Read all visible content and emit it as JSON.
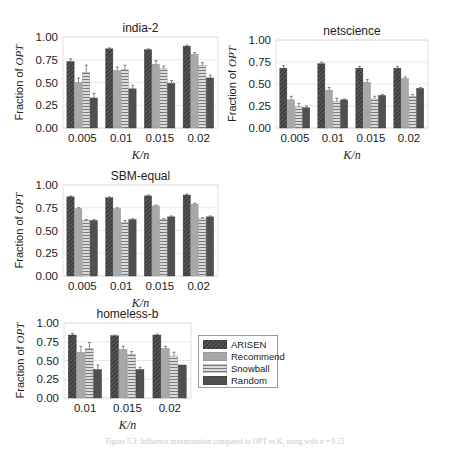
{
  "chart_data": [
    {
      "type": "bar",
      "title": "india-2",
      "xlabel": "K/n",
      "ylabel": "Fraction of OPT",
      "ylim": [
        0,
        1
      ],
      "yticks": [
        "0.00",
        "0.25",
        "0.50",
        "0.75",
        "1.00"
      ],
      "categories": [
        "0.005",
        "0.01",
        "0.015",
        "0.02"
      ],
      "series": [
        {
          "name": "ARISEN",
          "values": [
            0.73,
            0.87,
            0.86,
            0.9
          ],
          "errors": [
            0.03,
            0.01,
            0.01,
            0.01
          ]
        },
        {
          "name": "Recommend",
          "values": [
            0.5,
            0.63,
            0.7,
            0.81
          ],
          "errors": [
            0.05,
            0.04,
            0.04,
            0.02
          ]
        },
        {
          "name": "Snowball",
          "values": [
            0.61,
            0.64,
            0.65,
            0.69
          ],
          "errors": [
            0.08,
            0.05,
            0.03,
            0.03
          ]
        },
        {
          "name": "Random",
          "values": [
            0.33,
            0.43,
            0.49,
            0.55
          ],
          "errors": [
            0.05,
            0.04,
            0.03,
            0.03
          ]
        }
      ],
      "grid": true
    },
    {
      "type": "bar",
      "title": "netscience",
      "xlabel": "K/n",
      "ylabel": "Fraction of OPT",
      "ylim": [
        0,
        1
      ],
      "yticks": [
        "0.00",
        "0.25",
        "0.50",
        "0.75",
        "1.00"
      ],
      "categories": [
        "0.005",
        "0.01",
        "0.015",
        "0.02"
      ],
      "series": [
        {
          "name": "ARISEN",
          "values": [
            0.68,
            0.73,
            0.68,
            0.68
          ],
          "errors": [
            0.03,
            0.02,
            0.02,
            0.02
          ]
        },
        {
          "name": "Recommend",
          "values": [
            0.32,
            0.43,
            0.52,
            0.56
          ],
          "errors": [
            0.04,
            0.03,
            0.03,
            0.02
          ]
        },
        {
          "name": "Snowball",
          "values": [
            0.24,
            0.3,
            0.33,
            0.36
          ],
          "errors": [
            0.04,
            0.04,
            0.03,
            0.02
          ]
        },
        {
          "name": "Random",
          "values": [
            0.23,
            0.32,
            0.37,
            0.45
          ],
          "errors": [
            0.02,
            0.01,
            0.01,
            0.01
          ]
        }
      ],
      "grid": true
    },
    {
      "type": "bar",
      "title": "SBM-equal",
      "xlabel": "K/n",
      "ylabel": "Fraction of OPT",
      "ylim": [
        0,
        1
      ],
      "yticks": [
        "0.00",
        "0.25",
        "0.50",
        "0.75",
        "1.00"
      ],
      "categories": [
        "0.005",
        "0.01",
        "0.015",
        "0.02"
      ],
      "series": [
        {
          "name": "ARISEN",
          "values": [
            0.87,
            0.86,
            0.88,
            0.89
          ],
          "errors": [
            0.01,
            0.01,
            0.01,
            0.01
          ]
        },
        {
          "name": "Recommend",
          "values": [
            0.74,
            0.74,
            0.77,
            0.79
          ],
          "errors": [
            0.01,
            0.01,
            0.01,
            0.01
          ]
        },
        {
          "name": "Snowball",
          "values": [
            0.61,
            0.59,
            0.62,
            0.63
          ],
          "errors": [
            0.01,
            0.02,
            0.01,
            0.01
          ]
        },
        {
          "name": "Random",
          "values": [
            0.61,
            0.62,
            0.65,
            0.65
          ],
          "errors": [
            0.01,
            0.01,
            0.01,
            0.01
          ]
        }
      ],
      "grid": true
    },
    {
      "type": "bar",
      "title": "homeless-b",
      "xlabel": "K/n",
      "ylabel": "Fraction of OPT",
      "ylim": [
        0,
        1
      ],
      "yticks": [
        "0.00",
        "0.25",
        "0.50",
        "0.75",
        "1.00"
      ],
      "categories": [
        "0.01",
        "0.015",
        "0.02"
      ],
      "series": [
        {
          "name": "ARISEN",
          "values": [
            0.84,
            0.83,
            0.84
          ],
          "errors": [
            0.02,
            0.01,
            0.01
          ]
        },
        {
          "name": "Recommend",
          "values": [
            0.61,
            0.65,
            0.66
          ],
          "errors": [
            0.08,
            0.04,
            0.03
          ]
        },
        {
          "name": "Snowball",
          "values": [
            0.66,
            0.58,
            0.56
          ],
          "errors": [
            0.08,
            0.04,
            0.05
          ]
        },
        {
          "name": "Random",
          "values": [
            0.38,
            0.38,
            0.44
          ],
          "errors": [
            0.06,
            0.03,
            0.0
          ]
        }
      ],
      "grid": true
    }
  ],
  "legend": {
    "items": [
      {
        "label": "ARISEN",
        "pattern": "diagonal-hatch",
        "color": "#3a3a3a"
      },
      {
        "label": "Recommend",
        "pattern": "solid",
        "color": "#a8a8a8"
      },
      {
        "label": "Snowball",
        "pattern": "horizontal-lines",
        "color": "#8a8a8a"
      },
      {
        "label": "Random",
        "pattern": "solid",
        "color": "#4a4a4a"
      }
    ]
  },
  "caption": "Figure 5.3: Influence maximization compared to OPT vs K, using  with α = 0.15"
}
